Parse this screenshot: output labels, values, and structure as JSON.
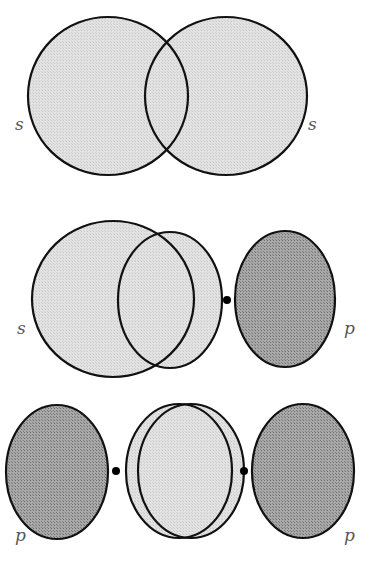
{
  "colors": {
    "light_fill": "#dcdcdc",
    "dark_fill": "#9a9a9a",
    "stroke": "#111111",
    "label": "#555555"
  },
  "panels": [
    {
      "name": "s-s-overlap",
      "labels": [
        {
          "text": "s",
          "x": 15,
          "y": 130
        },
        {
          "text": "s",
          "x": 308,
          "y": 130
        }
      ],
      "shapes": [
        {
          "type": "ellipse",
          "cx": 108,
          "cy": 96,
          "rx": 80,
          "ry": 79,
          "fill": "light"
        },
        {
          "type": "ellipse",
          "cx": 226,
          "cy": 96,
          "rx": 81,
          "ry": 79,
          "fill": "light"
        }
      ],
      "dots": []
    },
    {
      "name": "s-p-overlap",
      "labels": [
        {
          "text": "s",
          "x": 17,
          "y": 334
        },
        {
          "text": "p",
          "x": 344,
          "y": 334
        }
      ],
      "shapes": [
        {
          "type": "ellipse",
          "cx": 113,
          "cy": 299,
          "rx": 81,
          "ry": 78,
          "fill": "light"
        },
        {
          "type": "ellipse",
          "cx": 170,
          "cy": 300,
          "rx": 52,
          "ry": 68,
          "fill": "light"
        },
        {
          "type": "ellipse",
          "cx": 285,
          "cy": 299,
          "rx": 50,
          "ry": 68,
          "fill": "dark"
        }
      ],
      "dots": [
        {
          "cx": 227,
          "cy": 300,
          "r": 4
        }
      ]
    },
    {
      "name": "p-p-overlap",
      "labels": [
        {
          "text": "p",
          "x": 15,
          "y": 541
        },
        {
          "text": "p",
          "x": 344,
          "y": 541
        }
      ],
      "shapes": [
        {
          "type": "ellipse",
          "cx": 57,
          "cy": 472,
          "rx": 51,
          "ry": 67,
          "fill": "dark"
        },
        {
          "type": "ellipse",
          "cx": 179,
          "cy": 471,
          "rx": 53,
          "ry": 67,
          "fill": "light"
        },
        {
          "type": "ellipse",
          "cx": 191,
          "cy": 471,
          "rx": 53,
          "ry": 67,
          "fill": "light"
        },
        {
          "type": "ellipse",
          "cx": 303,
          "cy": 471,
          "rx": 51,
          "ry": 67,
          "fill": "dark"
        }
      ],
      "dots": [
        {
          "cx": 116,
          "cy": 471,
          "r": 4
        },
        {
          "cx": 244,
          "cy": 471,
          "r": 4
        }
      ]
    }
  ]
}
